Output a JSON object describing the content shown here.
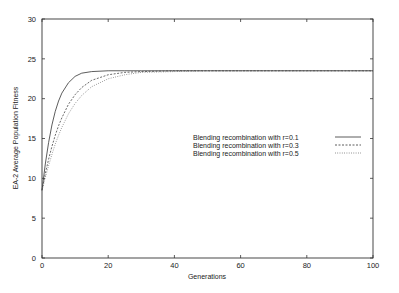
{
  "chart_data": {
    "type": "line",
    "title": "",
    "xlabel": "Generations",
    "ylabel": "EA-2 Average Population Fitness",
    "xlim": [
      0,
      100
    ],
    "ylim": [
      0,
      30
    ],
    "xticks": [
      0,
      20,
      40,
      60,
      80,
      100
    ],
    "yticks": [
      0,
      5,
      10,
      15,
      20,
      25,
      30
    ],
    "grid": false,
    "legend_position": "center-right",
    "x": [
      0,
      1,
      2,
      3,
      4,
      5,
      6,
      8,
      10,
      12,
      15,
      20,
      25,
      30,
      40,
      50,
      60,
      70,
      80,
      90,
      100
    ],
    "series": [
      {
        "name": "Blending recombination with r=0.1",
        "style": "solid",
        "values": [
          8.5,
          11.8,
          14.5,
          16.7,
          18.4,
          19.7,
          20.7,
          22.0,
          22.8,
          23.2,
          23.4,
          23.5,
          23.5,
          23.5,
          23.5,
          23.5,
          23.5,
          23.5,
          23.5,
          23.5,
          23.5
        ]
      },
      {
        "name": "Blending recombination with r=0.3",
        "style": "dashed",
        "values": [
          8.5,
          10.6,
          12.4,
          14.0,
          15.4,
          16.6,
          17.6,
          19.3,
          20.5,
          21.4,
          22.3,
          23.0,
          23.3,
          23.4,
          23.5,
          23.5,
          23.5,
          23.5,
          23.5,
          23.5,
          23.5
        ]
      },
      {
        "name": "Blending recombination with r=0.5",
        "style": "dotted",
        "values": [
          8.5,
          10.1,
          11.6,
          13.0,
          14.3,
          15.4,
          16.4,
          18.1,
          19.4,
          20.4,
          21.5,
          22.5,
          23.0,
          23.3,
          23.4,
          23.5,
          23.5,
          23.5,
          23.5,
          23.5,
          23.5
        ]
      }
    ]
  },
  "legend": {
    "items": [
      "Blending recombination with r=0.1",
      "Blending recombination with r=0.3",
      "Blending recombination with r=0.5"
    ]
  },
  "axes": {
    "xlabel": "Generations",
    "ylabel": "EA-2 Average Population Fitness"
  }
}
